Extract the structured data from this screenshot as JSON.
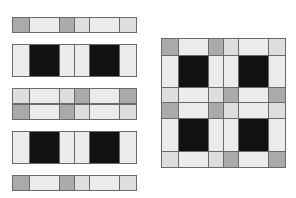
{
  "figure": {
    "colors": {
      "gray": "#aaaaaa",
      "light": "#ececec",
      "lighter": "#dedede",
      "black": "#111111",
      "border": "#6a6a6a"
    },
    "column_widths": [
      16,
      30,
      16,
      15,
      30,
      16
    ],
    "left_strips": [
      {
        "y": 17,
        "h": 16,
        "cells": [
          "g",
          "l",
          "g",
          "m",
          "l",
          "m"
        ]
      },
      {
        "y": 44,
        "h": 33,
        "cells": [
          "l",
          "k",
          "l",
          "l",
          "k",
          "l"
        ],
        "merged": [
          [
            0
          ],
          [
            1
          ],
          [
            2,
            3
          ],
          [
            4
          ],
          [
            5
          ]
        ]
      },
      {
        "y": 88,
        "h": 16,
        "cells": [
          "m",
          "l",
          "m",
          "g",
          "l",
          "g"
        ]
      },
      {
        "y": 104,
        "h": 16,
        "cells": [
          "g",
          "l",
          "g",
          "m",
          "l",
          "m"
        ]
      },
      {
        "y": 131,
        "h": 33,
        "cells": [
          "l",
          "k",
          "l",
          "l",
          "k",
          "l"
        ]
      },
      {
        "y": 175,
        "h": 16,
        "cells": [
          "g",
          "l",
          "g",
          "m",
          "l",
          "m"
        ]
      }
    ],
    "right_grid": {
      "x": 161,
      "y": 38,
      "rows": [
        {
          "h": 17,
          "cells": [
            "g",
            "l",
            "g",
            "m",
            "l",
            "m"
          ]
        },
        {
          "h": 32,
          "cells": [
            "l",
            "k",
            "l",
            "l",
            "k",
            "l"
          ]
        },
        {
          "h": 15,
          "cells": [
            "m",
            "l",
            "m",
            "g",
            "l",
            "g"
          ]
        },
        {
          "h": 16,
          "cells": [
            "g",
            "l",
            "g",
            "m",
            "l",
            "m"
          ]
        },
        {
          "h": 33,
          "cells": [
            "l",
            "k",
            "l",
            "l",
            "k",
            "l"
          ]
        },
        {
          "h": 16,
          "cells": [
            "m",
            "l",
            "m",
            "g",
            "l",
            "g"
          ]
        }
      ]
    }
  }
}
